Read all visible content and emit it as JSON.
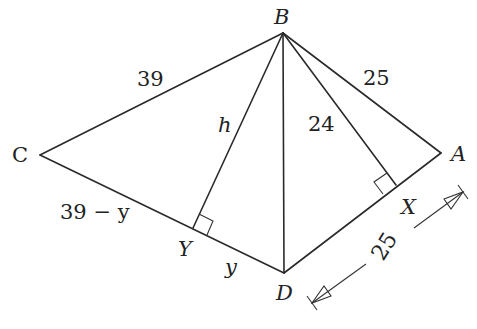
{
  "figure": {
    "vertices": {
      "A": {
        "label": "A",
        "x": 441,
        "y": 153
      },
      "B": {
        "label": "B",
        "x": 283,
        "y": 33
      },
      "C": {
        "label": "C",
        "x": 40,
        "y": 155
      },
      "D": {
        "label": "D",
        "x": 284,
        "y": 273
      },
      "X": {
        "label": "X",
        "x": 396,
        "y": 185
      },
      "Y": {
        "label": "Y",
        "x": 193,
        "y": 228
      }
    },
    "labels": {
      "BC": "39",
      "BA": "25",
      "BX": "24",
      "BY": "h",
      "CY": "39 − y",
      "YD": "y",
      "DA": "25"
    },
    "colors": {
      "stroke": "#2a2a2a",
      "text": "#222222",
      "background": "#ffffff"
    }
  }
}
